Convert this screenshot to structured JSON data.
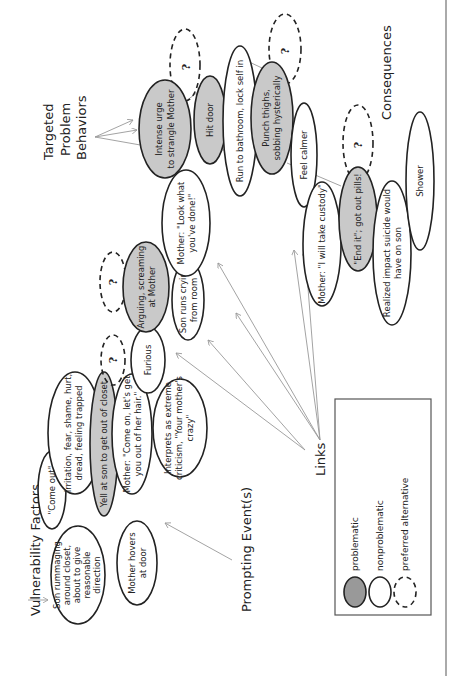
{
  "headings": {
    "vulnerability": "Vulnerability Factors",
    "prompting": "Prompting Event(s)",
    "targeted": [
      "Targeted",
      "Problem",
      "Behaviors"
    ],
    "consequences": "Consequences",
    "links": "Links"
  },
  "legend": {
    "problematic": "problematic",
    "nonproblematic": "nonproblematic",
    "preferred": "preferred alternative"
  },
  "colors": {
    "problematic_fill": "#c9c9c9",
    "outline": "#222222",
    "arrow": "#999999"
  },
  "nodes": {
    "son_rummaging": [
      "Son rummaging",
      "around closet,",
      "about to give",
      "reasonable",
      "direction"
    ],
    "mother_hovers": [
      "Mother hovers",
      "at door"
    ],
    "come_out": [
      "\"Come out\""
    ],
    "irritation": [
      "Irritation, fear, shame, hurt,",
      "dread, feeling trapped"
    ],
    "yell_at_son": [
      "Yell at son to get out of closet"
    ],
    "mother_come_on": [
      "Mother: \"Come on, let's get",
      "you out of her hair.\""
    ],
    "interprets": [
      "Interprets as extreme",
      "criticism, \"Your mother's",
      "crazy\""
    ],
    "furious": [
      "Furious"
    ],
    "arguing": [
      "Arguing, screaming",
      "at Mother"
    ],
    "son_runs": [
      "Son runs crying",
      "from room"
    ],
    "mother_look": [
      "Mother: \"Look what",
      "you've done!\""
    ],
    "intense_urge": [
      "Intense urge",
      "to strangle Mother"
    ],
    "hit_door": [
      "Hit door"
    ],
    "run_bathroom": [
      "Run to bathroom, lock self in"
    ],
    "punch_thighs": [
      "Punch thighs,",
      "sobbing hysterically"
    ],
    "feel_calmer": [
      "Feel calmer"
    ],
    "mother_custody": [
      "Mother: \"I will take custody\""
    ],
    "end_it": [
      "\"End it\"; got out pills!"
    ],
    "realized": [
      "Realized impact suicide would",
      "have on son"
    ],
    "shower": [
      "Shower"
    ],
    "question": "?"
  }
}
